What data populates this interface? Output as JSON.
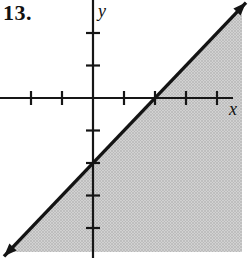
{
  "figure": {
    "problem_number": "13.",
    "background_color": "#ffffff"
  },
  "chart_data": {
    "type": "line",
    "xlabel": "x",
    "ylabel": "y",
    "x_ticks": [
      -2,
      -1,
      1,
      2,
      3,
      4
    ],
    "y_ticks": [
      -4,
      -3,
      -2,
      -1,
      1,
      2
    ],
    "xlim": [
      -3,
      4.95
    ],
    "ylim": [
      -4.95,
      3
    ],
    "grid": false,
    "axes_color": "#161616",
    "series": [
      {
        "name": "boundary-line",
        "equation": "y = x - 2",
        "slope": 1,
        "y_intercept": -2,
        "x_intercept": 2,
        "points": [
          [
            -2.87,
            -4.87
          ],
          [
            4.94,
            2.94
          ]
        ],
        "style": "solid",
        "arrows": "both",
        "color": "#141414"
      }
    ],
    "shaded_region": {
      "inequality": "y <= x - 2",
      "side": "below-right-of-line",
      "fill_base": "#d2d2d2",
      "fill_dot": "#a8a8a8"
    }
  }
}
